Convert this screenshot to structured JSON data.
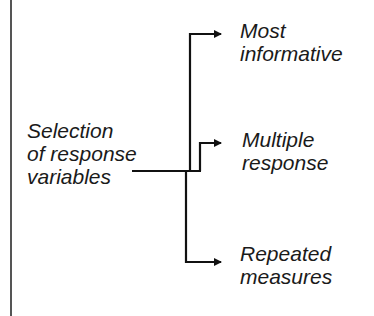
{
  "diagram": {
    "source": {
      "label": "Selection\nof response\nvariables"
    },
    "targets": [
      {
        "label": "Most\ninformative"
      },
      {
        "label": "Multiple\nresponse"
      },
      {
        "label": "Repeated\nmeasures"
      }
    ],
    "colors": {
      "line": "#111111",
      "text": "#1a1a1a",
      "frame": "#555555"
    }
  }
}
